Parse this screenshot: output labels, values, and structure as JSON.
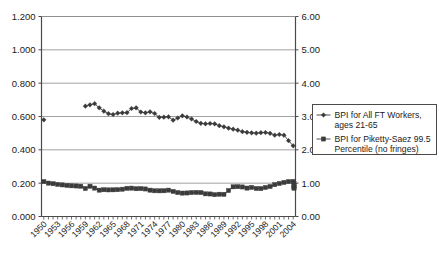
{
  "chart_data": {
    "type": "line",
    "title": "",
    "subtitle": "",
    "xlabel": "",
    "ylabel": "",
    "grid": true,
    "legend_position": "right",
    "x": [
      1950,
      1951,
      1952,
      1953,
      1954,
      1955,
      1956,
      1957,
      1958,
      1959,
      1960,
      1961,
      1962,
      1963,
      1964,
      1965,
      1966,
      1967,
      1968,
      1969,
      1970,
      1971,
      1972,
      1973,
      1974,
      1975,
      1976,
      1977,
      1978,
      1979,
      1980,
      1981,
      1982,
      1983,
      1984,
      1985,
      1986,
      1987,
      1988,
      1989,
      1990,
      1991,
      1992,
      1993,
      1994,
      1995,
      1996,
      1997,
      1998,
      1999,
      2000,
      2001,
      2002,
      2003,
      2004
    ],
    "xtick_labels": [
      "1950",
      "1953",
      "1956",
      "1959",
      "1962",
      "1965",
      "1968",
      "1971",
      "1974",
      "1977",
      "1980",
      "1983",
      "1986",
      "1989",
      "1992",
      "1995",
      "1998",
      "2001",
      "2004"
    ],
    "xtick_step_years": 3,
    "xlim": [
      1950,
      2004
    ],
    "left_axis": {
      "label": "",
      "ylim": [
        0.0,
        1.2
      ],
      "tick_step": 0.2,
      "tick_labels": [
        "0.000",
        "0.200",
        "0.400",
        "0.600",
        "0.800",
        "1.000",
        "1.200"
      ],
      "tick_values": [
        0.0,
        0.2,
        0.4,
        0.6,
        0.8,
        1.0,
        1.2
      ]
    },
    "right_axis": {
      "label": "",
      "ylim": [
        0.0,
        6.0
      ],
      "tick_step": 1.0,
      "tick_labels": [
        "0.00",
        "1.00",
        "2.00",
        "3.00",
        "4.00",
        "5.00",
        "6.00"
      ],
      "tick_values": [
        0.0,
        1.0,
        2.0,
        3.0,
        4.0,
        5.0,
        6.0
      ]
    },
    "series": [
      {
        "name": "BPI for All FT Workers, ages 21-65",
        "axis": "left",
        "marker": "diamond",
        "color": "#3b3b3b",
        "values": [
          0.58,
          null,
          null,
          null,
          null,
          null,
          null,
          null,
          null,
          0.662,
          0.67,
          0.677,
          0.652,
          0.632,
          0.617,
          0.612,
          0.62,
          0.622,
          0.623,
          0.648,
          0.652,
          0.627,
          0.622,
          0.628,
          0.618,
          0.595,
          0.596,
          0.598,
          0.578,
          0.591,
          0.604,
          0.597,
          0.585,
          0.57,
          0.559,
          0.556,
          0.558,
          0.556,
          0.545,
          0.538,
          0.53,
          0.524,
          0.518,
          0.509,
          0.505,
          0.502,
          0.5,
          0.503,
          0.504,
          0.499,
          0.488,
          0.492,
          0.488,
          0.455,
          0.424
        ]
      },
      {
        "name": "BPI for Piketty-Saez 99.5 Percentile (no fringes)",
        "axis": "right",
        "marker": "square",
        "color": "#3b3b3b",
        "values": [
          1.048,
          1.002,
          0.985,
          0.962,
          0.948,
          0.932,
          0.921,
          0.916,
          0.908,
          0.84,
          0.908,
          0.852,
          0.79,
          0.803,
          0.798,
          0.8,
          0.805,
          0.818,
          0.845,
          0.851,
          0.833,
          0.838,
          0.826,
          0.79,
          0.772,
          0.77,
          0.772,
          0.79,
          0.752,
          0.718,
          0.702,
          0.706,
          0.718,
          0.722,
          0.718,
          0.68,
          0.676,
          0.655,
          0.668,
          0.665,
          0.78,
          0.89,
          0.895,
          0.886,
          0.852,
          0.872,
          0.84,
          0.838,
          0.87,
          0.9,
          0.955,
          0.99,
          1.022,
          1.048,
          1.052
        ]
      }
    ],
    "series_tail": {
      "note": "upper series continues past 2004 tick within plot",
      "extra_x": [
        2005,
        2006,
        2007,
        2008
      ],
      "extra_values": [
        0.985,
        0.88,
        0.848,
        0.92
      ]
    },
    "annotations": []
  },
  "legend": {
    "entries": [
      {
        "label_line1": "BPI for All FT Workers,",
        "label_line2": "ages 21-65",
        "marker": "diamond"
      },
      {
        "label_line1": "BPI for Piketty-Saez 99.5",
        "label_line2": "Percentile (no fringes)",
        "marker": "square"
      }
    ]
  },
  "colors": {
    "series_ink": "#3b3b3b",
    "axis": "#4a4a4a",
    "grid": "#8a8a8a",
    "text": "#1a1a1a",
    "background": "#ffffff",
    "legend_border": "#4a4a4a"
  }
}
